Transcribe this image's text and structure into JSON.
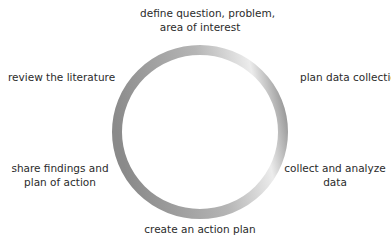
{
  "diagram": {
    "type": "cycle",
    "steps": [
      {
        "line1": "define question, problem,",
        "line2": "area of interest"
      },
      {
        "line1": "plan data collection",
        "line2": ""
      },
      {
        "line1": "collect and analyze",
        "line2": "data"
      },
      {
        "line1": "create an action plan",
        "line2": ""
      },
      {
        "line1": "share findings and",
        "line2": "plan of action"
      },
      {
        "line1": "review the literature",
        "line2": ""
      }
    ],
    "ring_colors": {
      "dark": "#8a8a8a",
      "light": "#e8e8e8"
    }
  }
}
